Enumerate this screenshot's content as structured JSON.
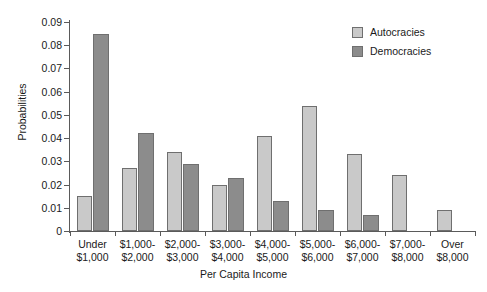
{
  "chart_data": {
    "type": "bar",
    "title": "",
    "xlabel": "Per Capita Income",
    "ylabel": "Probabilities",
    "ylim": [
      0,
      0.09
    ],
    "ytick_labels": [
      "0.09",
      "0.08",
      "0.07",
      "0.06",
      "0.05",
      "0.04",
      "0.03",
      "0.02",
      "0.01",
      "0"
    ],
    "ytick_values": [
      0.09,
      0.08,
      0.07,
      0.06,
      0.05,
      0.04,
      0.03,
      0.02,
      0.01,
      0
    ],
    "grid": false,
    "legend_position": "top-right",
    "categories": [
      "Under\n$1,000",
      "$1,000-\n$2,000",
      "$2,000-\n$3,000",
      "$3,000-\n$4,000",
      "$4,000-\n$5,000",
      "$5,000-\n$6,000",
      "$6,000-\n$7,000",
      "$7,000-\n$8,000",
      "Over\n$8,000"
    ],
    "category_lines": [
      [
        "Under",
        "$1,000"
      ],
      [
        "$1,000-",
        "$2,000"
      ],
      [
        "$2,000-",
        "$3,000"
      ],
      [
        "$3,000-",
        "$4,000"
      ],
      [
        "$4,000-",
        "$5,000"
      ],
      [
        "$5,000-",
        "$6,000"
      ],
      [
        "$6,000-",
        "$7,000"
      ],
      [
        "$7,000-",
        "$8,000"
      ],
      [
        "Over",
        "$8,000"
      ]
    ],
    "series": [
      {
        "name": "Autocracies",
        "color": "#c9c9c9",
        "values": [
          0.015,
          0.027,
          0.034,
          0.02,
          0.041,
          0.054,
          0.033,
          0.024,
          0.009
        ]
      },
      {
        "name": "Democracies",
        "color": "#8c8c8c",
        "values": [
          0.085,
          0.042,
          0.029,
          0.023,
          0.013,
          0.009,
          0.007,
          0,
          0
        ]
      }
    ]
  },
  "legend": {
    "entries": [
      {
        "label": "Autocracies"
      },
      {
        "label": "Democracies"
      }
    ]
  },
  "axes": {
    "y_title": "Probabilities",
    "x_title": "Per Capita Income"
  }
}
